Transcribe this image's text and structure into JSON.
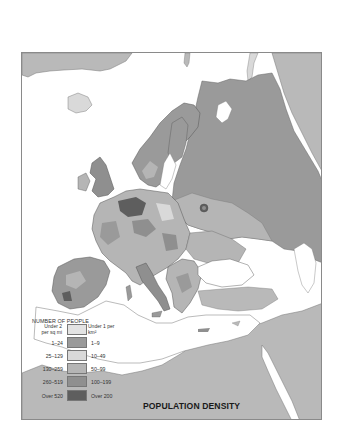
{
  "map": {
    "title": "POPULATION DENSITY",
    "region": "Europe",
    "colors": {
      "water": "#ffffff",
      "non_europe_land": "#b9b9b9",
      "border": "#8a8a8a"
    }
  },
  "legend": {
    "title": "NUMBER OF PEOPLE",
    "left_header": "Under 2 per sq mi",
    "right_header": "Under 1 per km²",
    "rows": [
      {
        "left": "1–24",
        "right": "1–9",
        "color": "#9a9a9a"
      },
      {
        "left": "25–129",
        "right": "10–49",
        "color": "#d9d9d9"
      },
      {
        "left": "130–259",
        "right": "50–99",
        "color": "#b5b5b5"
      },
      {
        "left": "260–519",
        "right": "100–199",
        "color": "#8f8f8f"
      },
      {
        "left": "Over 520",
        "right": "Over 200",
        "color": "#5e5e5e"
      }
    ],
    "under_color": "#e3e3e3"
  }
}
